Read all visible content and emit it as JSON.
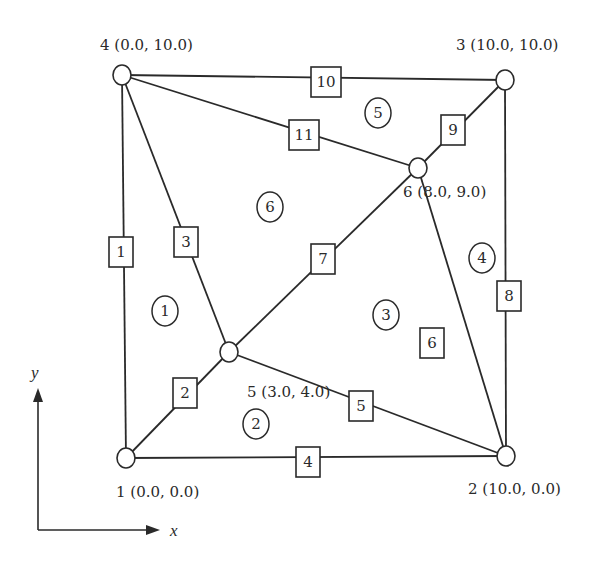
{
  "diagram": {
    "type": "finite-element-mesh",
    "nodes": [
      {
        "id": 1,
        "label": "1 (0.0, 0.0)",
        "x": 0.0,
        "y": 0.0
      },
      {
        "id": 2,
        "label": "2 (10.0, 0.0)",
        "x": 10.0,
        "y": 0.0
      },
      {
        "id": 3,
        "label": "3 (10.0, 10.0)",
        "x": 10.0,
        "y": 10.0
      },
      {
        "id": 4,
        "label": "4 (0.0, 10.0)",
        "x": 0.0,
        "y": 10.0
      },
      {
        "id": 5,
        "label": "5 (3.0, 4.0)",
        "x": 3.0,
        "y": 4.0
      },
      {
        "id": 6,
        "label": "6 (8.0, 9.0)",
        "x": 8.0,
        "y": 9.0
      }
    ],
    "edges": [
      {
        "id": 1,
        "label": "1",
        "from": 1,
        "to": 4
      },
      {
        "id": 2,
        "label": "2",
        "from": 1,
        "to": 5
      },
      {
        "id": 3,
        "label": "3",
        "from": 5,
        "to": 4
      },
      {
        "id": 4,
        "label": "4",
        "from": 1,
        "to": 2
      },
      {
        "id": 5,
        "label": "5",
        "from": 5,
        "to": 2
      },
      {
        "id": 6,
        "label": "6",
        "from": 2,
        "to": 6
      },
      {
        "id": 7,
        "label": "7",
        "from": 5,
        "to": 6
      },
      {
        "id": 8,
        "label": "8",
        "from": 2,
        "to": 3
      },
      {
        "id": 9,
        "label": "9",
        "from": 6,
        "to": 3
      },
      {
        "id": 10,
        "label": "10",
        "from": 4,
        "to": 3
      },
      {
        "id": 11,
        "label": "11",
        "from": 4,
        "to": 6
      }
    ],
    "elements": [
      {
        "id": 1,
        "label": "1"
      },
      {
        "id": 2,
        "label": "2"
      },
      {
        "id": 3,
        "label": "3"
      },
      {
        "id": 4,
        "label": "4"
      },
      {
        "id": 5,
        "label": "5"
      },
      {
        "id": 6,
        "label": "6"
      }
    ],
    "axes": {
      "x_label": "x",
      "y_label": "y"
    }
  }
}
